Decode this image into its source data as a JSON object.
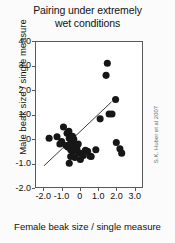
{
  "chart_data": {
    "type": "scatter",
    "title": "Pairing under extremely wet conditions",
    "title_lines": [
      "Pairing under extremely",
      "wet conditions"
    ],
    "xlabel": "Female beak size / single measure",
    "ylabel": "Male beak size / single measure",
    "credit": "S.K. Huber et al 2007",
    "xlim": [
      -2.45,
      3.45
    ],
    "ylim": [
      -2.0,
      4.0
    ],
    "xticks": [
      -2.0,
      -1.0,
      0,
      1.0,
      2.0,
      3.0
    ],
    "xtick_labels": [
      "-2.0",
      "-1.0",
      "0",
      "1.0",
      "2.0",
      "3.0"
    ],
    "yticks": [
      -2.0,
      -1.0,
      0,
      1.0,
      2.0,
      3.0,
      4.0
    ],
    "ytick_labels": [
      "-2.0",
      "-1.0",
      "0",
      "1.0",
      "2.0",
      "3.0",
      "4.0"
    ],
    "grid": false,
    "legend": "none",
    "marker_color": "#161616",
    "marker_size": 3.6,
    "line_color": "#3a3a3a",
    "trendline": {
      "x": [
        -2.0,
        1.75
      ],
      "y": [
        -1.12,
        1.52
      ]
    },
    "points": [
      {
        "x": 1.52,
        "y": 3.12
      },
      {
        "x": 1.45,
        "y": 2.62
      },
      {
        "x": 1.98,
        "y": 1.62
      },
      {
        "x": 1.62,
        "y": 1.02
      },
      {
        "x": 1.78,
        "y": 1.02
      },
      {
        "x": 1.12,
        "y": 0.82
      },
      {
        "x": -0.92,
        "y": 0.48
      },
      {
        "x": -1.72,
        "y": 0.02
      },
      {
        "x": -1.28,
        "y": 0.08
      },
      {
        "x": -0.72,
        "y": 0.22
      },
      {
        "x": -0.62,
        "y": 0.3
      },
      {
        "x": -0.6,
        "y": 0.02
      },
      {
        "x": -1.02,
        "y": -0.12
      },
      {
        "x": -1.12,
        "y": -0.22
      },
      {
        "x": -0.78,
        "y": -0.28
      },
      {
        "x": -0.68,
        "y": -0.34
      },
      {
        "x": -0.55,
        "y": -0.22
      },
      {
        "x": -0.48,
        "y": -0.1
      },
      {
        "x": -0.42,
        "y": 0.1
      },
      {
        "x": -0.35,
        "y": -0.02
      },
      {
        "x": -0.3,
        "y": -0.26
      },
      {
        "x": -0.52,
        "y": -0.46
      },
      {
        "x": -0.38,
        "y": -0.52
      },
      {
        "x": -0.18,
        "y": -0.4
      },
      {
        "x": -0.1,
        "y": -0.22
      },
      {
        "x": -0.05,
        "y": -0.58
      },
      {
        "x": 0.08,
        "y": -0.62
      },
      {
        "x": 0.18,
        "y": -0.7
      },
      {
        "x": 0.02,
        "y": -0.86
      },
      {
        "x": -0.28,
        "y": -0.78
      },
      {
        "x": -0.52,
        "y": -0.74
      },
      {
        "x": -0.6,
        "y": -1.02
      },
      {
        "x": 0.3,
        "y": -0.48
      },
      {
        "x": 0.42,
        "y": -0.52
      },
      {
        "x": 0.55,
        "y": -0.72
      },
      {
        "x": 0.62,
        "y": -0.74
      },
      {
        "x": 0.88,
        "y": -0.46
      },
      {
        "x": 2.02,
        "y": -0.16
      },
      {
        "x": 2.22,
        "y": -0.42
      },
      {
        "x": 2.32,
        "y": -0.6
      }
    ]
  }
}
